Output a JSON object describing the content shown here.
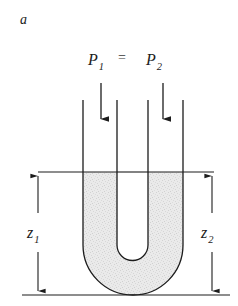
{
  "figure": {
    "panel_letter": "a",
    "background_color": "#ffffff",
    "line_color": "#1c1c1c",
    "fluid_fill_color": "#e9e9e9",
    "fluid_speckle_color": "#cfcfcf",
    "width": 238,
    "height": 306
  },
  "pressure_relation": {
    "left_symbol": "P",
    "left_subscript": "1",
    "operator": "=",
    "right_symbol": "P",
    "right_subscript": "2",
    "full_text": "P1 = P2"
  },
  "arrows": {
    "left_pressure_arrow_name": "downward-arrow",
    "right_pressure_arrow_name": "downward-arrow",
    "count": 2,
    "direction": "down"
  },
  "heights": {
    "left": {
      "symbol": "z",
      "subscript": "1",
      "full_text": "z1"
    },
    "right": {
      "symbol": "z",
      "subscript": "2",
      "full_text": "z2"
    }
  },
  "geometry": {
    "outer_left_wall_x": 83,
    "inner_left_wall_x": 117,
    "inner_right_wall_x": 148,
    "outer_right_wall_x": 183,
    "tube_top_y": 100,
    "liquid_level_y": 172,
    "baseline_y": 295,
    "bend_center_x": 133,
    "bend_center_y": 245,
    "outer_radius": 50,
    "inner_radius": 15.5,
    "left_dimension_x": 38,
    "right_dimension_x": 212,
    "left_arrow_x": 101,
    "right_arrow_x": 163,
    "arrow_top_y": 83,
    "arrow_bottom_y": 121
  }
}
